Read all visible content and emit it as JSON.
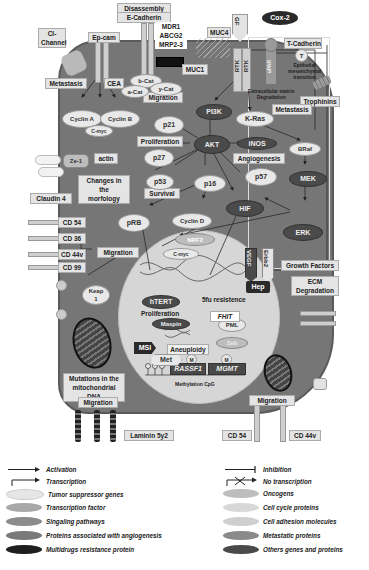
{
  "membrane_labels": {
    "disassembly": "Disassembly",
    "e_cadherin": "E-Cadherin",
    "cl_channel": "Cl-\nChannel",
    "ep_cam": "Ep-cam",
    "mdr": "MDR1\nABCG2\nMRP2-3",
    "muc4": "MUC4",
    "gf": "GF",
    "muc1": "MUC1",
    "t_cadherin": "T-Cadherin",
    "t": "T",
    "claudin4": "Claudin 4",
    "cd54": "CD 54",
    "cd36": "CD 36",
    "cd44v": "CD 44v",
    "cd99": "CD 99",
    "laminin": "Laminin 5y2",
    "cd54_bottom": "CD 54",
    "cd44v_bottom": "CD 44v",
    "trophinins": "Trophinins",
    "rtk1": "RTK",
    "rtk2": "RTK",
    "upar": "uPAR"
  },
  "annotations": {
    "metastasis_left": "Metastasis",
    "cea": "CEA",
    "migration_top": "Migration",
    "emt": "Epithelial\nmesenchymal\ntransition",
    "ecm_deg_top": "Extracellular matrix\nDegradation",
    "metastasis_right": "Metastasis",
    "proliferation_top": "Proliferation",
    "angiogenesis": "Angiogenesis",
    "changes": "Changes in the\nmorfology",
    "survival": "Survival",
    "migration_left": "Migration",
    "growth_factors": "Growth Factors",
    "ecm_deg": "ECM\nDegradation",
    "fu_resist": "5fu resistence",
    "proliferation_nuc": "Proliferation",
    "aneuploidy": "Aneuploidy",
    "methylation": "Methylation CpG",
    "mito_mut": "Mutations in the\nmitochondrial DNA",
    "migration_bl": "Migration",
    "migration_br": "Migration",
    "actin": "actin"
  },
  "nodes": {
    "cox2": "Cox-2",
    "b_cat": "b-Cat",
    "a_cat": "a-Cat",
    "y_cat": "y-Cat",
    "cyclin_a": "Cyclin A",
    "cyclin_b": "Cyclin B",
    "c_myc_top": "C-myc",
    "p21": "p21",
    "pi3k": "PI3K",
    "k_ras": "K-Ras",
    "ze1": "Ze-1",
    "p27": "p27",
    "akt": "AKT",
    "inos": "iNOS",
    "braf": "BRaf",
    "p53": "p53",
    "p16": "p16",
    "p57": "p57",
    "mek": "MEK",
    "prb": "pRB",
    "cyclin_d": "Cyclin D",
    "hif": "HIF",
    "erk": "ERK",
    "nrf2": "NRF2",
    "c_myc_nuc": "C-myc",
    "vegf": "VEGF",
    "erbb2": "Erbb2",
    "keap1": "Keap\n1",
    "hep": "Hep",
    "htert": "hTERT",
    "fhit": "FHIT",
    "maspin": "Maspin",
    "pml": "PML",
    "msi": "MSI",
    "zeb": "Zeb",
    "rassf1": "RASSF1",
    "mgmt": "MGMT",
    "met": "Met",
    "m1": "M",
    "m2": "M"
  },
  "legend": {
    "left": [
      {
        "label": "Activation",
        "kind": "arrow"
      },
      {
        "label": "Transcription",
        "kind": "transcription"
      },
      {
        "label": "Tumor suppressor genes",
        "kind": "oval",
        "color": "#e6e6e6"
      },
      {
        "label": "Transcription factor",
        "kind": "oval",
        "color": "#a8a8a8"
      },
      {
        "label": "Singaling pathways",
        "kind": "oval",
        "color": "#8c8c8c"
      },
      {
        "label": "Proteins associated with angiogenesis",
        "kind": "oval",
        "color": "#7a7a7a"
      },
      {
        "label": "Multidrugs resistance protein",
        "kind": "oval",
        "color": "#1e1e1e"
      }
    ],
    "right": [
      {
        "label": "Inhibition",
        "kind": "inhibit"
      },
      {
        "label": "No transcription",
        "kind": "notrans"
      },
      {
        "label": "Oncogens",
        "kind": "oval",
        "color": "#bdbdbd"
      },
      {
        "label": "Cell cycle proteins",
        "kind": "oval",
        "color": "#d8d8d8"
      },
      {
        "label": "Cell adhesion molecules",
        "kind": "oval",
        "color": "#cfcfcf"
      },
      {
        "label": "Metastatic proteins",
        "kind": "oval",
        "color": "#8a8a8a"
      },
      {
        "label": "Others genes and proteins",
        "kind": "oval",
        "color": "#4a4a4a"
      }
    ]
  },
  "colors": {
    "cytoplasm": "#767676",
    "nucleus": "#d6d6d6",
    "label_bg": "#e4e4e4"
  }
}
